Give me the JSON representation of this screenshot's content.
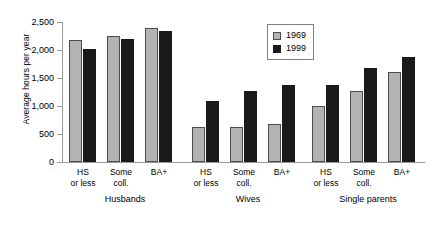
{
  "chart_data": {
    "type": "bar",
    "title": "",
    "subtitle": "",
    "xlabel": "",
    "ylabel": "Average hours per year",
    "ylim": [
      0,
      2500
    ],
    "ytick_values": [
      0,
      500,
      1000,
      1500,
      2000,
      2500
    ],
    "ytick_labels": [
      "0",
      "500",
      "1,000",
      "1,500",
      "2,000",
      "2,500"
    ],
    "grid": false,
    "legend_position": "top-right",
    "legend": [
      "1969",
      "1999"
    ],
    "categories": [
      "HS or less",
      "Some coll.",
      "BA+"
    ],
    "group_labels": [
      "Husbands",
      "Wives",
      "Single parents"
    ],
    "series": [
      {
        "name": "1969",
        "color": "#b3b3b3",
        "groups": [
          {
            "group": "Husbands",
            "values": [
              2175,
              2250,
              2400
            ]
          },
          {
            "group": "Wives",
            "values": [
              625,
              625,
              680
            ]
          },
          {
            "group": "Single parents",
            "values": [
              1000,
              1275,
              1610
            ]
          }
        ]
      },
      {
        "name": "1999",
        "color": "#1a1a1a",
        "groups": [
          {
            "group": "Husbands",
            "values": [
              2010,
              2190,
              2340
            ]
          },
          {
            "group": "Wives",
            "values": [
              1090,
              1275,
              1370
            ]
          },
          {
            "group": "Single parents",
            "values": [
              1375,
              1675,
              1880
            ]
          }
        ]
      }
    ]
  }
}
